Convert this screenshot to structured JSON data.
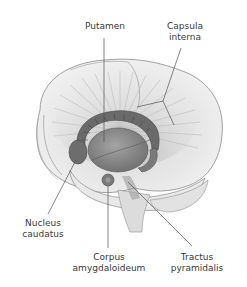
{
  "figure": {
    "colors": {
      "background": "#ffffff",
      "brain_fill": "#ececec",
      "brain_outline": "#8a8a8a",
      "fibers": "#b8b8b8",
      "nuclei_dark": "#5a5a5a",
      "putamen_fill": "#8c8c8c",
      "leader_line": "#555555",
      "label_text": "#3a3a3a"
    },
    "labels": {
      "putamen": [
        "Putamen"
      ],
      "capsula_interna": [
        "Capsula",
        "interna"
      ],
      "nucleus_caudatus": [
        "Nucleus",
        "caudatus"
      ],
      "corpus_amygdaloideum": [
        "Corpus",
        "amygdaloideum"
      ],
      "tractus_pyramidalis": [
        "Tractus",
        "pyramidalis"
      ]
    }
  }
}
